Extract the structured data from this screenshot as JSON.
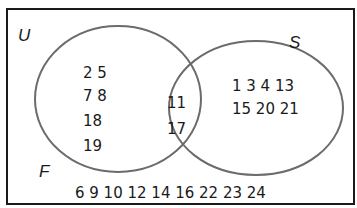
{
  "diagram": {
    "type": "venn",
    "universal_set": {
      "label": "U"
    },
    "sets": [
      {
        "id": "F",
        "label": "F"
      },
      {
        "id": "S",
        "label": "S"
      }
    ],
    "regions": {
      "F_only": {
        "lines": [
          "2 5",
          "7 8",
          "18",
          "19"
        ],
        "values": [
          2,
          5,
          7,
          8,
          18,
          19
        ]
      },
      "F_and_S": {
        "lines": [
          "11",
          "17"
        ],
        "values": [
          11,
          17
        ]
      },
      "S_only": {
        "lines": [
          "1 3 4 13",
          "15 20 21"
        ],
        "values": [
          1,
          3,
          4,
          13,
          15,
          20,
          21
        ]
      },
      "neither": {
        "lines": [
          "6 9 10 12 14 16 22 23 24"
        ],
        "values": [
          6,
          9,
          10,
          12,
          14,
          16,
          22,
          23,
          24
        ]
      }
    },
    "colors": {
      "frame": "#1a1a1a",
      "ellipse": "#6b6b6b",
      "text": "#1a1a1a"
    }
  }
}
